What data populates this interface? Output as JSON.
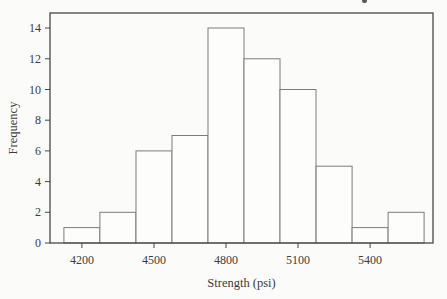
{
  "chart_data": {
    "type": "bar",
    "subtype": "histogram",
    "xlabel": "Strength (psi)",
    "ylabel": "Frequency",
    "bin_centers": [
      4200,
      4350,
      4500,
      4650,
      4800,
      4950,
      5100,
      5250,
      5400,
      5550
    ],
    "bin_width": 150,
    "values": [
      1,
      2,
      6,
      7,
      14,
      12,
      10,
      5,
      1,
      2
    ],
    "x_ticks": [
      4200,
      4500,
      4800,
      5100,
      5400
    ],
    "y_ticks": [
      0,
      2,
      4,
      6,
      8,
      10,
      12,
      14
    ],
    "xlim": [
      4067,
      5662
    ],
    "ylim": [
      0,
      14.98
    ],
    "grid": false,
    "legend": false,
    "frame": "full-box",
    "colors": {
      "background": "#fbfbf9",
      "bar_fill": "#fdfdfc",
      "bar_stroke": "#7c7c7c",
      "frame_stroke": "#474747",
      "text": "#3c3c3c"
    }
  }
}
